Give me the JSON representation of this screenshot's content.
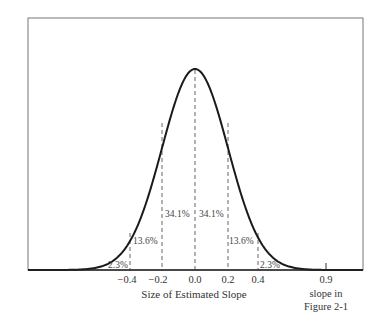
{
  "chart_data": {
    "type": "area",
    "title": "",
    "xlabel": "Size of Estimated Slope",
    "ylabel": "",
    "distribution": "normal",
    "mean": 0.0,
    "std_dev": 0.2,
    "x_ticks": [
      "-0.4",
      "-0.2",
      "0.0",
      "0.2",
      "0.4",
      "0.9"
    ],
    "x_tick_values": [
      -0.4,
      -0.2,
      0.0,
      0.2,
      0.4,
      0.9
    ],
    "regions": [
      {
        "range": "< -0.4",
        "label": "2.3%",
        "value": 2.3
      },
      {
        "range": "-0.4 to -0.2",
        "label": "13.6%",
        "value": 13.6
      },
      {
        "range": "-0.2 to 0.0",
        "label": "34.1%",
        "value": 34.1
      },
      {
        "range": "0.0 to 0.2",
        "label": "34.1%",
        "value": 34.1
      },
      {
        "range": "0.2 to 0.4",
        "label": "13.6%",
        "value": 13.6
      },
      {
        "range": "> 0.4",
        "label": "2.3%",
        "value": 2.3
      }
    ],
    "annotation": "slope in Figure 2-1",
    "annotation_x": 0.9,
    "grid": false,
    "legend": "none"
  },
  "labels": {
    "xlabel": "Size of Estimated Slope",
    "ticks": [
      "−0.4",
      "−0.2",
      "0.0",
      "0.2",
      "0.4",
      "0.9"
    ],
    "annotation_line1": "slope in",
    "annotation_line2": "Figure 2-1",
    "pct_far_left": "2.3%",
    "pct_left": "13.6%",
    "pct_center_left": "34.1%",
    "pct_center_right": "34.1%",
    "pct_right": "13.6%",
    "pct_far_right": "2.3%"
  }
}
